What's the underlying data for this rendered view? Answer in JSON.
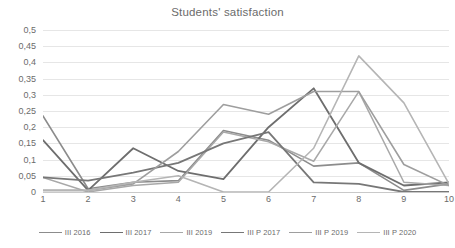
{
  "chart_data": {
    "type": "line",
    "title": "Students' satisfaction",
    "xlabel": "",
    "ylabel": "",
    "categories": [
      "1",
      "2",
      "3",
      "4",
      "5",
      "6",
      "7",
      "8",
      "9",
      "10"
    ],
    "ylim": [
      0,
      0.5
    ],
    "ytick_labels": [
      "0,5",
      "0,45",
      "0,4",
      "0,35",
      "0,3",
      "0,25",
      "0,2",
      "0,15",
      "0,1",
      "0,05",
      "0"
    ],
    "ytick_values": [
      0.5,
      0.45,
      0.4,
      0.35,
      0.3,
      0.25,
      0.2,
      0.15,
      0.1,
      0.05,
      0
    ],
    "grid": "horizontal",
    "legend_position": "bottom",
    "decimal_separator": ",",
    "series": [
      {
        "name": "III 2016",
        "color": "#8c8c8c",
        "width": 1.6,
        "values": [
          0.235,
          0.01,
          0.03,
          0.035,
          0.19,
          0.16,
          0.08,
          0.09,
          0.005,
          0.025
        ]
      },
      {
        "name": "III 2017",
        "color": "#6e6e6e",
        "width": 1.8,
        "values": [
          0.16,
          0.005,
          0.135,
          0.065,
          0.04,
          0.2,
          0.32,
          0.09,
          0.02,
          0.03
        ]
      },
      {
        "name": "III 2019",
        "color": "#a8a8a8",
        "width": 1.5,
        "values": [
          0.045,
          0.0,
          0.02,
          0.03,
          0.185,
          0.155,
          0.095,
          0.31,
          0.03,
          0.02
        ]
      },
      {
        "name": "III P 2017",
        "color": "#777777",
        "width": 1.8,
        "values": [
          0.045,
          0.035,
          0.06,
          0.09,
          0.15,
          0.185,
          0.03,
          0.025,
          0.0,
          0.0
        ]
      },
      {
        "name": "III P 2019",
        "color": "#9e9e9e",
        "width": 1.6,
        "values": [
          0.005,
          0.005,
          0.025,
          0.125,
          0.27,
          0.24,
          0.31,
          0.31,
          0.085,
          0.02
        ]
      },
      {
        "name": "III P 2020",
        "color": "#b5b5b5",
        "width": 1.6,
        "values": [
          0.005,
          0.005,
          0.03,
          0.05,
          0.0,
          0.0,
          0.135,
          0.42,
          0.275,
          0.025
        ]
      }
    ]
  }
}
